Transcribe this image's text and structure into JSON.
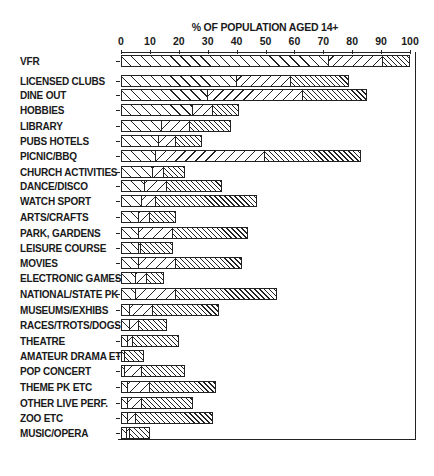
{
  "chart_data": {
    "type": "bar",
    "orientation": "horizontal",
    "stacked": true,
    "title": "% OF POPULATION AGED 14+",
    "xlabel": "% OF POPULATION AGED 14+",
    "ylabel": "",
    "xlim": [
      0,
      100
    ],
    "xticks": [
      0,
      10,
      20,
      30,
      40,
      50,
      60,
      70,
      80,
      90,
      100
    ],
    "grid": false,
    "legend": "none",
    "categories": [
      "VFR",
      "LICENSED CLUBS",
      "DINE OUT",
      "HOBBIES",
      "LIBRARY",
      "PUBS HOTELS",
      "PICNIC/BBQ",
      "CHURCH ACTIVITIES",
      "DANCE/DISCO",
      "WATCH SPORT",
      "ARTS/CRAFTS",
      "PARK, GARDENS",
      "LEISURE COURSE",
      "MOVIES",
      "ELECTRONIC GAMES",
      "NATIONAL/STATE PK",
      "MUSEUMS/EXHIBS",
      "RACES/TROTS/DOGS",
      "THEATRE",
      "AMATEUR DRAMA ETC",
      "POP CONCERT",
      "THEME PK ETC",
      "OTHER LIVE PERF.",
      "ZOO ETC",
      "MUSIC/OPERA"
    ],
    "segment_boundaries": [
      [
        72,
        91,
        100
      ],
      [
        40,
        59,
        79
      ],
      [
        30,
        63,
        85
      ],
      [
        25,
        32,
        41
      ],
      [
        14,
        24,
        38
      ],
      [
        13,
        19,
        28
      ],
      [
        12,
        50,
        83
      ],
      [
        11,
        15,
        22
      ],
      [
        8,
        16,
        35
      ],
      [
        7,
        12,
        47
      ],
      [
        6,
        10,
        19
      ],
      [
        6,
        18,
        44
      ],
      [
        6,
        7,
        18
      ],
      [
        6,
        19,
        42
      ],
      [
        5,
        9,
        15
      ],
      [
        5,
        19,
        54
      ],
      [
        3,
        11,
        34
      ],
      [
        3,
        6,
        16
      ],
      [
        2,
        4,
        20
      ],
      [
        1,
        1,
        8
      ],
      [
        1,
        7,
        22
      ],
      [
        2,
        10,
        33
      ],
      [
        2,
        7,
        25
      ],
      [
        2,
        5,
        32
      ],
      [
        2,
        3,
        10
      ]
    ],
    "series": [
      {
        "name": "segment 1 (light backslash hatch)",
        "values": [
          72,
          40,
          30,
          25,
          14,
          13,
          12,
          11,
          8,
          7,
          6,
          6,
          6,
          6,
          5,
          5,
          3,
          3,
          2,
          1,
          1,
          2,
          2,
          2,
          2
        ]
      },
      {
        "name": "segment 2 (light slash hatch)",
        "values": [
          19,
          19,
          33,
          7,
          10,
          6,
          38,
          4,
          8,
          5,
          4,
          12,
          1,
          13,
          4,
          14,
          8,
          3,
          2,
          0,
          6,
          8,
          5,
          3,
          1
        ]
      },
      {
        "name": "segment 3 (dense hatch)",
        "values": [
          9,
          20,
          22,
          9,
          14,
          9,
          33,
          7,
          19,
          35,
          9,
          26,
          11,
          23,
          6,
          35,
          23,
          10,
          16,
          7,
          15,
          23,
          18,
          27,
          7
        ]
      }
    ],
    "totals": [
      100,
      79,
      85,
      41,
      38,
      28,
      83,
      22,
      35,
      47,
      19,
      44,
      18,
      42,
      15,
      54,
      34,
      16,
      20,
      8,
      22,
      33,
      25,
      32,
      10
    ]
  },
  "ui": {
    "axis_title": "% OF POPULATION AGED 14+",
    "tick_labels": [
      "0",
      "10",
      "20",
      "30",
      "40",
      "50",
      "60",
      "70",
      "80",
      "90",
      "100"
    ],
    "labels": [
      "VFR",
      "LICENSED CLUBS",
      "DINE OUT",
      "HOBBIES",
      "LIBRARY",
      "PUBS HOTELS",
      "PICNIC/BBQ",
      "CHURCH ACTIVITIES",
      "DANCE/DISCO",
      "WATCH SPORT",
      "ARTS/CRAFTS",
      "PARK, GARDENS",
      "LEISURE COURSE",
      "MOVIES",
      "ELECTRONIC GAMES",
      "NATIONAL/STATE PK",
      "MUSEUMS/EXHIBS",
      "RACES/TROTS/DOGS;",
      "THEATRE",
      "AMATEUR DRAMA ETC",
      "POP CONCERT",
      "THEME PK ETC",
      "OTHER LIVE PERF.",
      "ZOO ETC",
      "MUSIC/OPERA"
    ]
  }
}
